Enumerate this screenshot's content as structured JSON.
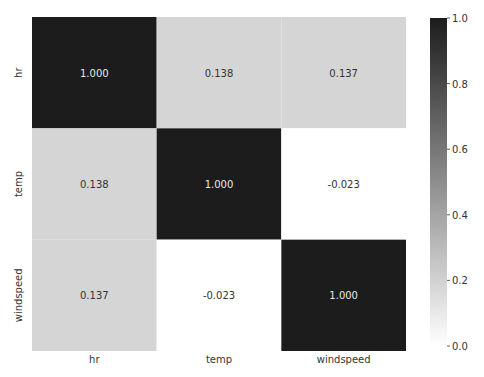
{
  "chart_data": {
    "type": "heatmap",
    "title": "",
    "xlabel": "",
    "ylabel": "",
    "x_categories": [
      "hr",
      "temp",
      "windspeed"
    ],
    "y_categories": [
      "hr",
      "temp",
      "windspeed"
    ],
    "values": [
      [
        1.0,
        0.138,
        0.137
      ],
      [
        0.138,
        1.0,
        -0.023
      ],
      [
        0.137,
        -0.023,
        1.0
      ]
    ],
    "value_format": "0.000",
    "colormap": "Greys",
    "vmin": 0.0,
    "vmax": 1.0,
    "colorbar": {
      "ticks": [
        0.0,
        0.2,
        0.4,
        0.6,
        0.8,
        1.0
      ],
      "tick_labels": [
        "0.0",
        "0.2",
        "0.4",
        "0.6",
        "0.8",
        "1.0"
      ],
      "placement": "right"
    },
    "colors": {
      "low": "#ffffff",
      "high": "#1c1c1c",
      "annot_dark": "#333333",
      "annot_light": "#e8e8e8"
    }
  }
}
